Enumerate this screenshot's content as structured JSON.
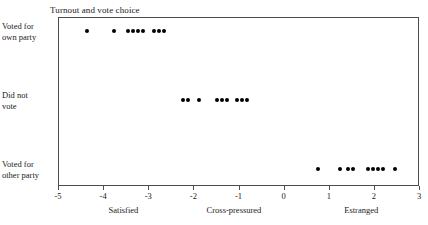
{
  "chart_data": {
    "type": "scatter",
    "title": "Turnout and vote choice",
    "xlabel": "",
    "ylabel": "",
    "xlim": [
      -5,
      3
    ],
    "xticks": [
      -5,
      -4,
      -3,
      -2,
      -1,
      0,
      1,
      2,
      3
    ],
    "xticklabels": [
      "-5",
      "-4",
      "-3",
      "-2",
      "-1",
      "0",
      "1",
      "2",
      "3"
    ],
    "grid": false,
    "legend": null,
    "categories": [
      "Voted for own party",
      "Did not vote",
      "Voted for other party"
    ],
    "category_labels": [
      {
        "line1": "Voted for",
        "line2": "own party"
      },
      {
        "line1": "Did not",
        "line2": "vote"
      },
      {
        "line1": "Voted for",
        "line2": "other party"
      }
    ],
    "annotations": [
      {
        "text": "Satisfied",
        "x": -3.55
      },
      {
        "text": "Cross-pressured",
        "x": -1.1
      },
      {
        "text": "Estranged",
        "x": 1.72
      }
    ],
    "series": [
      {
        "name": "Voted for own party",
        "row": 0,
        "x": [
          -4.35,
          -3.76,
          -3.45,
          -3.33,
          -3.22,
          -3.11,
          -2.88,
          -2.77,
          -2.66
        ]
      },
      {
        "name": "Did not vote",
        "row": 1,
        "x": [
          -2.22,
          -2.11,
          -1.88,
          -1.47,
          -1.36,
          -1.25,
          -1.03,
          -0.92,
          -0.81
        ]
      },
      {
        "name": "Voted for other party",
        "row": 2,
        "x": [
          0.77,
          1.24,
          1.42,
          1.53,
          1.88,
          1.99,
          2.1,
          2.21,
          2.47
        ]
      }
    ],
    "marker": {
      "shape": "circle",
      "color": "#000000",
      "size": 4
    },
    "frame_color": "#4d4d4d",
    "background": "#ffffff"
  }
}
